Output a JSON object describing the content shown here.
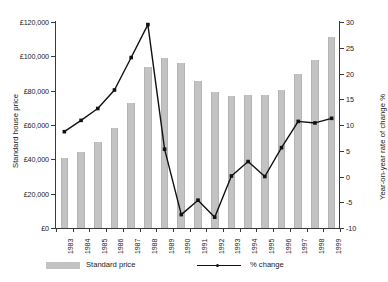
{
  "chart_data": {
    "type": "bar",
    "title": "",
    "xlabel": "",
    "ylabel": "Standard house price",
    "y2label": "Year-on-year rate of change %",
    "grid": false,
    "legend_position": "bottom",
    "categories": [
      "1983",
      "1984",
      "1985",
      "1986",
      "1987",
      "1988",
      "1989",
      "1990",
      "1991",
      "1992",
      "1993",
      "1994",
      "1995",
      "1996",
      "1997",
      "1998",
      "1999"
    ],
    "ylim": [
      0,
      120000
    ],
    "yticks": [
      0,
      20000,
      40000,
      60000,
      80000,
      100000,
      120000
    ],
    "ytick_labels": [
      "£0",
      "£20,000",
      "£40,000",
      "£60,000",
      "£80,000",
      "£100,000",
      "£120,000"
    ],
    "y2lim": [
      -10,
      30
    ],
    "y2ticks": [
      -10,
      -5,
      0,
      5,
      10,
      15,
      20,
      25,
      30
    ],
    "y2tick_labels": [
      "-10",
      "-5",
      "0",
      "5",
      "10",
      "15",
      "20",
      "25",
      "30"
    ],
    "series": [
      {
        "name": "Standard price",
        "type": "bar",
        "axis": "left",
        "color": "#c3c3c3",
        "values": [
          40500,
          44000,
          50000,
          58500,
          73000,
          94000,
          99000,
          96000,
          85500,
          79000,
          77000,
          77500,
          77500,
          80500,
          89500,
          98000,
          111000
        ]
      },
      {
        "name": "% change",
        "type": "line",
        "axis": "right",
        "color": "#111111",
        "values": [
          8.7,
          10.9,
          13.2,
          16.8,
          23.1,
          29.5,
          5.3,
          -7.4,
          -4.6,
          -7.9,
          0.1,
          2.9,
          0.0,
          5.6,
          10.7,
          10.4,
          11.3
        ]
      }
    ]
  },
  "legend": {
    "bar_label": "Standard price",
    "line_label": "% change"
  }
}
